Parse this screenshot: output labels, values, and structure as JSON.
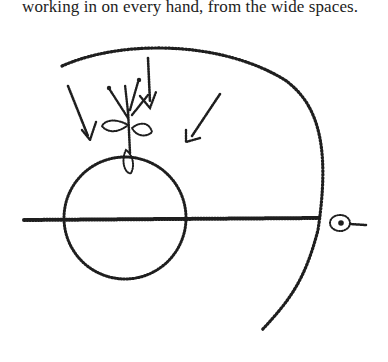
{
  "document": {
    "text_line": "working in on every hand, from the wide spaces."
  },
  "figure": {
    "ink_color": "#1e1e1e"
  }
}
